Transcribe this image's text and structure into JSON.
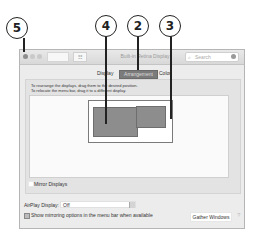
{
  "callouts": [
    {
      "number": "5",
      "target": "close-button"
    },
    {
      "number": "4",
      "target": "display-arrangement-area"
    },
    {
      "number": "2",
      "target": "arrangement-tab"
    },
    {
      "number": "3",
      "target": "display-selection-frame"
    }
  ],
  "window": {
    "title": "Built-in Retina Display",
    "grid_icon": "☷",
    "search": {
      "icon": "⌕",
      "placeholder": "Search"
    }
  },
  "tabs": [
    {
      "label": "Display",
      "selected": false
    },
    {
      "label": "Arrangement",
      "selected": true
    },
    {
      "label": "Color",
      "selected": false
    }
  ],
  "arrangement": {
    "instruction_1": "To rearrange the displays, drag them to the desired position.",
    "instruction_2": "To relocate the menu bar, drag it to a different display.",
    "mirror_label": "Mirror Displays",
    "mirror_checked": false
  },
  "footer": {
    "airplay_label": "AirPlay Display:",
    "airplay_value": "Off",
    "show_mirroring_label": "Show mirroring options in the menu bar when available",
    "show_mirroring_checked": true,
    "gather_button": "Gather Windows",
    "help_icon": "?"
  },
  "colors": {
    "display_fill": "#8d8d8d",
    "selected_tab": "#7b7b7b",
    "window_bg": "#ececec"
  }
}
